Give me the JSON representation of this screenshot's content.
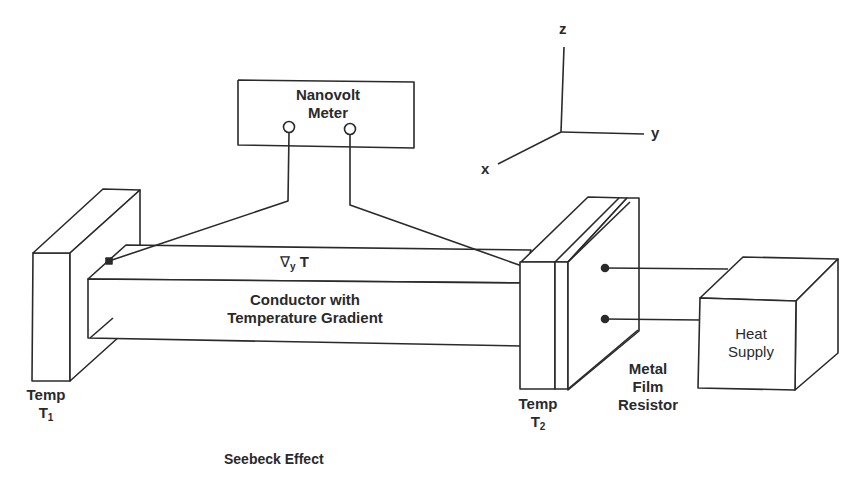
{
  "diagram": {
    "title": "Seebeck Effect",
    "instrument": {
      "line1": "Nanovolt",
      "line2": "Meter"
    },
    "conductor": {
      "gradient_symbol": "∇",
      "gradient_sub": "y",
      "gradient_var": "T",
      "line1": "Conductor with",
      "line2": "Temperature Gradient"
    },
    "left_block": {
      "line1": "Temp",
      "sym": "T",
      "sub": "1"
    },
    "right_block": {
      "line1": "Temp",
      "sym": "T",
      "sub": "2"
    },
    "resistor": {
      "line1": "Metal",
      "line2": "Film",
      "line3": "Resistor"
    },
    "heater": {
      "line1": "Heat",
      "line2": "Supply"
    },
    "axes": {
      "x": "x",
      "y": "y",
      "z": "z"
    },
    "colors": {
      "stroke": "#2a2a2a",
      "background": "#ffffff"
    }
  }
}
